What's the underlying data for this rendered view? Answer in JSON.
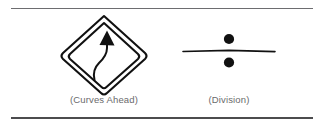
{
  "figure": {
    "background_color": "#ffffff",
    "rules": {
      "top_color": "#6d6d70",
      "bottom_color": "#4c4c4e"
    },
    "caption_color": "#6a6a6c",
    "ink_color": "#111111",
    "items": [
      {
        "id": "curves-ahead",
        "icon_name": "curves-ahead-road-sign-icon",
        "caption": "(Curves Ahead)",
        "description": "Double-outlined rounded diamond warning sign containing an S-shaped curving arrow pointing up and to the left"
      },
      {
        "id": "division",
        "icon_name": "division-sign-icon",
        "caption": "(Division)",
        "description": "Obelus: a horizontal rule with one filled dot above and one filled dot below"
      }
    ]
  }
}
